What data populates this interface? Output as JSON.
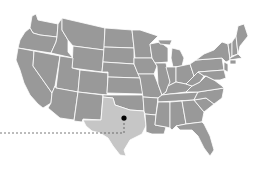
{
  "map": {
    "region": "Contiguous United States",
    "base_color": "#999999",
    "border_color": "#ffffff",
    "highlighted_state": {
      "name": "Texas",
      "color": "#c6c6c6"
    },
    "marker": {
      "location": "North-central Texas",
      "color": "#000000",
      "x": 124,
      "y": 118
    },
    "leader_line": {
      "style": "dashed",
      "color": "#555555",
      "from": [
        0,
        133
      ],
      "corner": [
        124,
        133
      ],
      "to": [
        124,
        118
      ]
    }
  }
}
